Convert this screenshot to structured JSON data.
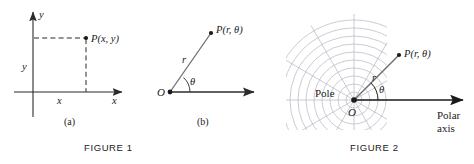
{
  "figure1": {
    "caption": "FIGURE 1",
    "panel_a": {
      "sublabel": "(a)",
      "axis_x_label": "x",
      "axis_y_label": "y",
      "point_label": "P(x, y)",
      "leg_x_label": "x",
      "leg_y_label": "y"
    },
    "panel_b": {
      "sublabel": "(b)",
      "origin_label": "O",
      "point_label": "P(r, θ)",
      "radius_label": "r",
      "angle_label": "θ"
    }
  },
  "figure2": {
    "caption": "FIGURE 2",
    "pole_label": "Pole",
    "origin_label": "O",
    "point_label": "P(r, θ)",
    "radius_label": "r",
    "angle_label": "θ",
    "axis_label_line1": "Polar",
    "axis_label_line2": "axis"
  },
  "colors": {
    "ink": "#1a1a1a",
    "line": "#2b2b2b",
    "grid": "#b9b9c4",
    "background": "#ffffff"
  }
}
